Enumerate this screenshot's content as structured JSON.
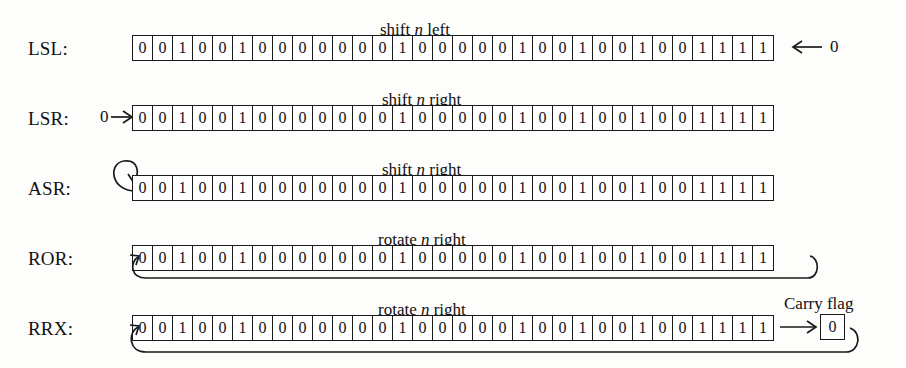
{
  "figure": {
    "bits": [
      "0",
      "0",
      "1",
      "0",
      "0",
      "1",
      "0",
      "0",
      "0",
      "0",
      "0",
      "0",
      "0",
      "1",
      "0",
      "0",
      "0",
      "0",
      "0",
      "1",
      "0",
      "0",
      "1",
      "0",
      "0",
      "1",
      "0",
      "0",
      "1",
      "1",
      "1",
      "1"
    ],
    "carry_flag_label": "Carry flag",
    "carry_flag_value": "0"
  },
  "rows": [
    {
      "label": "LSL:",
      "caption_pre": "shift ",
      "caption_var": "n",
      "caption_post": " left",
      "in_bit_right": "0",
      "icon": "double-chevron-left-icon"
    },
    {
      "label": "LSR:",
      "caption_pre": "shift ",
      "caption_var": "n",
      "caption_post": " right",
      "in_bit_left": "0",
      "icon": "double-chevron-right-icon"
    },
    {
      "label": "ASR:",
      "caption_pre": "shift ",
      "caption_var": "n",
      "caption_post": " right",
      "icon": "sign-extend-loop-icon"
    },
    {
      "label": "ROR:",
      "caption_pre": "rotate ",
      "caption_var": "n",
      "caption_post": " right",
      "icon": "rotate-wrap-icon"
    },
    {
      "label": "RRX:",
      "caption_pre": "rotate ",
      "caption_var": "n",
      "caption_post": " right",
      "icon": "rotate-through-carry-icon"
    }
  ]
}
